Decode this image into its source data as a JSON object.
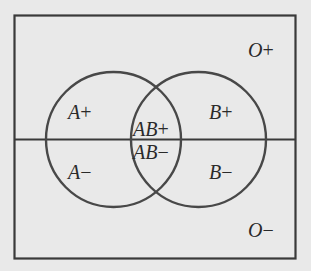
{
  "diagram": {
    "type": "venn",
    "title": "",
    "colors": {
      "background": "#e9e9e9",
      "stroke": "#404040",
      "text": "#2a2a2a"
    },
    "sets": [
      {
        "name": "A",
        "description": "left circle"
      },
      {
        "name": "B",
        "description": "right circle"
      }
    ],
    "divider": "horizontal line splitting Rh+ (top) and Rh- (bottom)",
    "regions": {
      "o_pos": {
        "letter": "O",
        "sign": "+"
      },
      "a_pos": {
        "letter": "A",
        "sign": "+"
      },
      "ab_pos": {
        "letter": "AB",
        "sign": "+"
      },
      "b_pos": {
        "letter": "B",
        "sign": "+"
      },
      "a_neg": {
        "letter": "A",
        "sign": "−"
      },
      "ab_neg": {
        "letter": "AB",
        "sign": "−"
      },
      "b_neg": {
        "letter": "B",
        "sign": "−"
      },
      "o_neg": {
        "letter": "O",
        "sign": "−"
      }
    }
  }
}
